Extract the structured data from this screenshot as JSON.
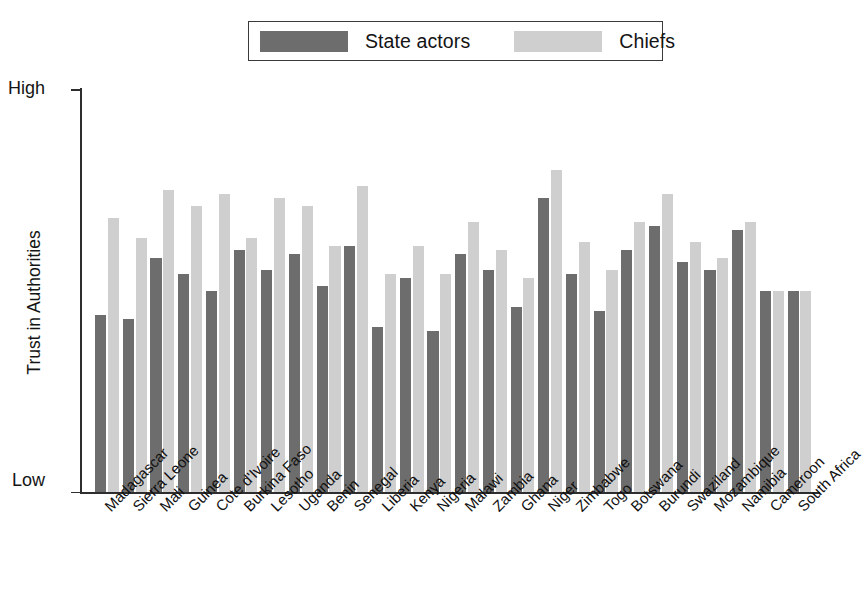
{
  "chart_data": {
    "type": "bar",
    "title": "",
    "xlabel": "",
    "ylabel": "Trust in Authorities",
    "ylim": [
      0,
      100
    ],
    "ytick_labels": [
      "Low",
      "High"
    ],
    "ytick_values": [
      0,
      100
    ],
    "grid": false,
    "legend_position": "top-center",
    "legend": [
      "State actors",
      "Chiefs"
    ],
    "categories": [
      "Madagascar",
      "Sierra Leone",
      "Mali",
      "Guinea",
      "Cote d'Ivoire",
      "Burkina Faso",
      "Lesotho",
      "Uganda",
      "Benin",
      "Senegal",
      "Liberia",
      "Kenya",
      "Nigeria",
      "Malawi",
      "Zambia",
      "Ghana",
      "Niger",
      "Zimbabwe",
      "Togo",
      "Botswana",
      "Burundi",
      "Swaziland",
      "Mozambique",
      "Namibia",
      "Cameroon",
      "South Africa"
    ],
    "series": [
      {
        "name": "State actors",
        "color": "#6d6d6d",
        "values": [
          44,
          43,
          58,
          54,
          50,
          60,
          55,
          59,
          51,
          61,
          41,
          53,
          40,
          59,
          55,
          46,
          73,
          54,
          45,
          60,
          66,
          57,
          55,
          65,
          50,
          50
        ]
      },
      {
        "name": "Chiefs",
        "color": "#cfcfcf",
        "values": [
          68,
          63,
          75,
          71,
          74,
          63,
          73,
          71,
          61,
          76,
          54,
          61,
          54,
          67,
          60,
          53,
          80,
          62,
          55,
          67,
          74,
          62,
          58,
          67,
          50,
          50
        ]
      }
    ]
  },
  "legend": {
    "items": [
      {
        "label": "State actors",
        "swatch": "dark"
      },
      {
        "label": "Chiefs",
        "swatch": "light"
      }
    ]
  },
  "axes": {
    "y_title": "Trust in Authorities",
    "y_high_label": "High",
    "y_low_label": "Low"
  },
  "colors": {
    "state_actors": "#6d6d6d",
    "chiefs": "#cfcfcf",
    "axis": "#2e2e2e",
    "background": "#ffffff"
  }
}
